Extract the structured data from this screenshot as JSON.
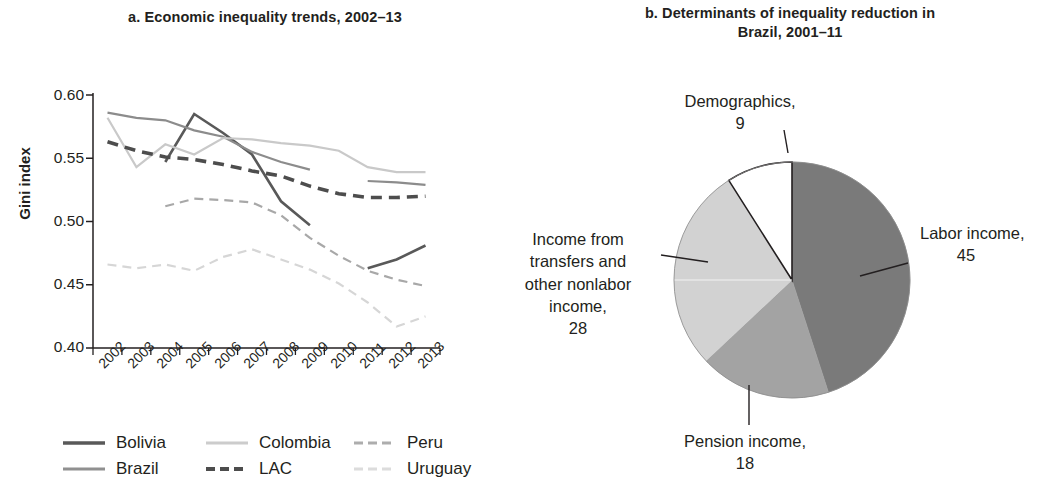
{
  "panel_a": {
    "title": "a. Economic inequality trends, 2002–13",
    "y_axis_label": "Gini index",
    "y_ticks": [
      "0.60",
      "0.55",
      "0.50",
      "0.45",
      "0.40"
    ],
    "x_ticks": [
      "2002",
      "2003",
      "2004",
      "2005",
      "2006",
      "2007",
      "2008",
      "2009",
      "2010",
      "2011",
      "2012",
      "2013"
    ],
    "legend": [
      {
        "label": "Bolivia",
        "style": "solid",
        "color": "#595959"
      },
      {
        "label": "Colombia",
        "style": "solid",
        "color": "#c9c9c9"
      },
      {
        "label": "Peru",
        "style": "dashed",
        "color": "#a8a8a8"
      },
      {
        "label": "Brazil",
        "style": "solid",
        "color": "#8c8c8c"
      },
      {
        "label": "LAC",
        "style": "dashed",
        "color": "#4d4d4d"
      },
      {
        "label": "Uruguay",
        "style": "dashed",
        "color": "#d6d6d6"
      }
    ]
  },
  "panel_b": {
    "title": "b. Determinants of inequality reduction in Brazil, 2001–11",
    "labels": {
      "labor": "Labor income,",
      "labor_value": "45",
      "pension": "Pension income,",
      "pension_value": "18",
      "transfers": "Income from transfers and other nonlabor income,",
      "transfers_value": "28",
      "demographics": "Demographics,",
      "demographics_value": "9"
    }
  },
  "chart_data": [
    {
      "type": "line",
      "title": "a. Economic inequality trends, 2002–13",
      "xlabel": "",
      "ylabel": "Gini index",
      "ylim": [
        0.4,
        0.6
      ],
      "grid": false,
      "legend_position": "bottom",
      "x": [
        2002,
        2003,
        2004,
        2005,
        2006,
        2007,
        2008,
        2009,
        2010,
        2011,
        2012,
        2013
      ],
      "series": [
        {
          "name": "Bolivia",
          "color": "#595959",
          "style": "solid",
          "values": [
            0.58,
            null,
            0.547,
            0.585,
            0.57,
            0.553,
            0.516,
            0.497,
            null,
            0.463,
            0.47,
            0.481
          ]
        },
        {
          "name": "Brazil",
          "color": "#8c8c8c",
          "style": "solid",
          "values": [
            0.586,
            0.582,
            0.58,
            0.572,
            0.567,
            0.555,
            0.547,
            0.541,
            null,
            0.532,
            0.531,
            0.529
          ]
        },
        {
          "name": "Colombia",
          "color": "#c9c9c9",
          "style": "solid",
          "values": [
            0.582,
            0.543,
            0.561,
            0.553,
            0.566,
            0.565,
            0.562,
            0.56,
            0.556,
            0.543,
            0.539,
            0.539
          ]
        },
        {
          "name": "LAC",
          "color": "#4d4d4d",
          "style": "dashed",
          "values": [
            0.563,
            0.556,
            0.551,
            0.549,
            0.545,
            0.54,
            0.536,
            0.528,
            0.522,
            0.519,
            0.519,
            0.52
          ]
        },
        {
          "name": "Peru",
          "color": "#a8a8a8",
          "style": "dashed",
          "values": [
            null,
            null,
            0.512,
            0.518,
            0.517,
            0.515,
            0.505,
            0.487,
            0.473,
            0.461,
            0.454,
            0.449
          ]
        },
        {
          "name": "Uruguay",
          "color": "#d6d6d6",
          "style": "dashed",
          "values": [
            0.466,
            0.463,
            0.466,
            0.461,
            0.472,
            0.478,
            0.47,
            0.462,
            0.451,
            0.436,
            0.417,
            0.425
          ]
        }
      ]
    },
    {
      "type": "pie",
      "title": "b. Determinants of inequality reduction in Brazil, 2001–11",
      "categories": [
        "Labor income",
        "Pension income",
        "Income from transfers and other nonlabor income",
        "Demographics"
      ],
      "values": [
        45,
        18,
        28,
        9
      ],
      "colors": [
        "#7a7a7a",
        "#a3a3a3",
        "#d2d2d2",
        "#ffffff"
      ],
      "start_angle": 0,
      "direction": "clockwise",
      "legend_position": "callout-labels"
    }
  ]
}
